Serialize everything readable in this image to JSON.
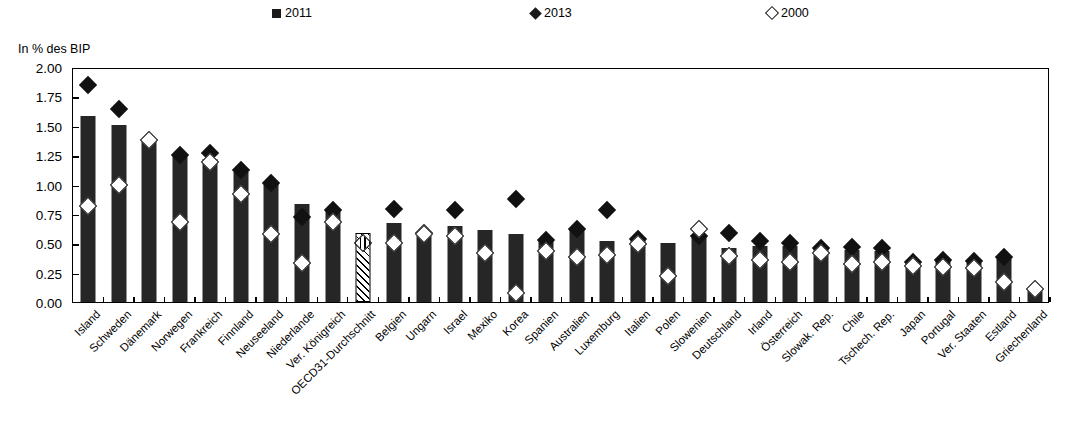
{
  "legend": {
    "items": [
      {
        "name": "2011",
        "marker": "filled-square",
        "x": 272
      },
      {
        "name": "2013",
        "marker": "filled-diamond",
        "x": 531
      },
      {
        "name": "2000",
        "marker": "open-diamond",
        "x": 767
      }
    ]
  },
  "axis": {
    "y_title": "In % des BIP",
    "y_ticks": [
      "0.00",
      "0.25",
      "0.50",
      "0.75",
      "1.00",
      "1.25",
      "1.50",
      "1.75",
      "2.00"
    ],
    "y_min": 0.0,
    "y_max": 2.0
  },
  "chart_data": {
    "type": "bar",
    "title": "",
    "subtitle": "",
    "xlabel": "",
    "ylabel": "In % des BIP",
    "ylim": [
      0.0,
      2.0
    ],
    "ytick_step": 0.25,
    "grid": false,
    "legend_position": "top",
    "categories": [
      "Island",
      "Schweden",
      "Dänemark",
      "Norwegen",
      "Frankreich",
      "Finnland",
      "Neuseeland",
      "Niederlande",
      "Ver. Königreich",
      "OECD31-Durchschnitt",
      "Belgien",
      "Ungarn",
      "Israel",
      "Mexiko",
      "Korea",
      "Spanien",
      "Australien",
      "Luxemburg",
      "Italien",
      "Polen",
      "Slowenien",
      "Deutschland",
      "Irland",
      "Österreich",
      "Slowak. Rep.",
      "Chile",
      "Tschech. Rep.",
      "Japan",
      "Portugal",
      "Ver. Staaten",
      "Estland",
      "Griechenland"
    ],
    "highlight_category": "OECD31-Durchschnitt",
    "series": [
      {
        "name": "2011",
        "marker": "filled-square",
        "type": "bar",
        "values": [
          1.58,
          1.51,
          1.37,
          1.25,
          1.22,
          1.11,
          1.01,
          0.83,
          0.78,
          0.59,
          0.67,
          0.59,
          0.65,
          0.61,
          0.58,
          0.52,
          0.61,
          0.52,
          0.53,
          0.5,
          0.56,
          0.46,
          0.48,
          0.48,
          0.45,
          0.44,
          0.43,
          0.34,
          0.35,
          0.33,
          0.38,
          0.1
        ]
      },
      {
        "name": "2013",
        "marker": "filled-diamond",
        "type": "scatter",
        "values": [
          1.85,
          1.64,
          null,
          1.25,
          1.27,
          1.12,
          1.01,
          0.72,
          0.78,
          null,
          0.79,
          0.59,
          0.78,
          null,
          0.88,
          0.53,
          0.62,
          0.78,
          0.54,
          null,
          0.56,
          0.59,
          0.52,
          0.5,
          0.46,
          0.47,
          0.46,
          0.34,
          0.36,
          0.35,
          0.38,
          null
        ]
      },
      {
        "name": "2000",
        "marker": "open-diamond",
        "type": "scatter",
        "values": [
          0.82,
          1.0,
          1.38,
          0.68,
          1.19,
          0.92,
          0.58,
          0.33,
          0.68,
          0.5,
          0.5,
          0.58,
          0.56,
          0.42,
          0.08,
          0.43,
          0.38,
          0.4,
          0.49,
          0.22,
          0.62,
          0.39,
          0.36,
          0.34,
          0.42,
          0.32,
          0.34,
          0.31,
          0.3,
          0.29,
          0.17,
          0.11
        ]
      }
    ]
  }
}
